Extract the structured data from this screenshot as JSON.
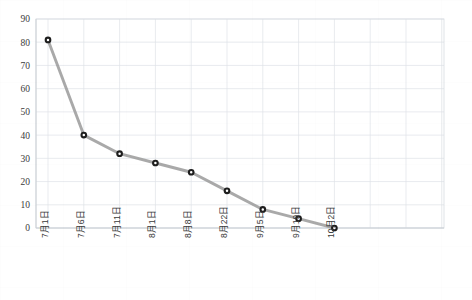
{
  "chart_data": {
    "type": "line",
    "title": "",
    "subtitle": "",
    "xlabel": "",
    "ylabel": "",
    "categories": [
      "7月1日",
      "7月6日",
      "7月11日",
      "8月1日",
      "8月8日",
      "8月22日",
      "9月5日",
      "9月19日",
      "10月2日"
    ],
    "values": [
      81,
      40,
      32,
      28,
      24,
      16,
      8,
      4,
      0
    ],
    "series": [
      {
        "name": "",
        "values": [
          81,
          40,
          32,
          28,
          24,
          16,
          8,
          4,
          0
        ]
      }
    ],
    "ylim": [
      0,
      90
    ],
    "yticks": [
      0,
      10,
      20,
      30,
      40,
      50,
      60,
      70,
      80,
      90
    ],
    "ytick_labels": [
      "0",
      "10",
      "20",
      "30",
      "40",
      "50",
      "60",
      "70",
      "80",
      "90"
    ],
    "grid": true,
    "legend": false,
    "legend_position": "none",
    "xlabel_rotation": -90,
    "marker": "circle",
    "colors": {
      "line": "#9a9a9a",
      "marker_fill": "#ffffff",
      "marker_edge": "#1d1d1d",
      "grid": "#dfe3e8",
      "frame": "#d7dbe0",
      "text": "#3a3a3a",
      "background": "#ffffff"
    }
  }
}
